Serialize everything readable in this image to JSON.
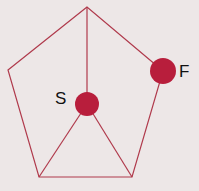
{
  "diagram": {
    "shape": "pentagon",
    "colors": {
      "background": "#ede7e7",
      "line": "#b03a4c",
      "node": "#b81e3c",
      "label": "#111111"
    },
    "vertices": [
      {
        "x": 87,
        "y": 7
      },
      {
        "x": 8,
        "y": 70
      },
      {
        "x": 39,
        "y": 177
      },
      {
        "x": 132,
        "y": 177
      },
      {
        "x": 163,
        "y": 71
      }
    ],
    "nodes": [
      {
        "id": "S",
        "label": "S",
        "x": 87,
        "y": 104,
        "r": 12
      },
      {
        "id": "F",
        "label": "F",
        "x": 163,
        "y": 71,
        "r": 13
      }
    ],
    "labels": {
      "S": "S",
      "F": "F"
    }
  }
}
